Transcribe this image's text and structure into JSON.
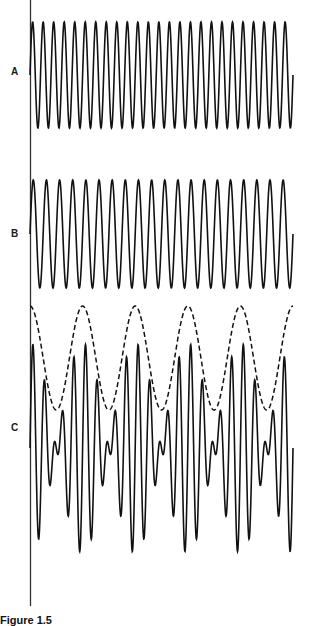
{
  "figure": {
    "caption": "Figure 1.5",
    "axis": {
      "x": 30.5,
      "y_top": 0,
      "y_bottom": 606,
      "color": "#333333"
    },
    "x_start": 30,
    "x_end": 293,
    "stroke_color": "#111111"
  },
  "chart_data": {
    "type": "line",
    "title": "",
    "xlabel": "",
    "ylabel": "",
    "grid": false,
    "series": [
      {
        "name": "A",
        "label": "A",
        "center_y": 75,
        "amplitude": 53,
        "period_px": 10.52,
        "cycles": 25,
        "style": "solid"
      },
      {
        "name": "B",
        "label": "B",
        "center_y": 234,
        "amplitude": 54,
        "period_px": 13.15,
        "cycles": 20,
        "style": "solid"
      },
      {
        "name": "C",
        "label": "C",
        "center_y": 448,
        "amplitude": 52.5,
        "composition": "A + B",
        "style": "solid"
      },
      {
        "name": "C-envelope",
        "label": "",
        "center_y": 358,
        "amplitude": 52,
        "period_px": 52.6,
        "cycles": 5,
        "style": "dashed"
      }
    ]
  },
  "labels": {
    "A": {
      "text": "A",
      "x": 11,
      "y": 67
    },
    "B": {
      "text": "B",
      "x": 11,
      "y": 229
    },
    "C": {
      "text": "C",
      "x": 11,
      "y": 423
    }
  }
}
